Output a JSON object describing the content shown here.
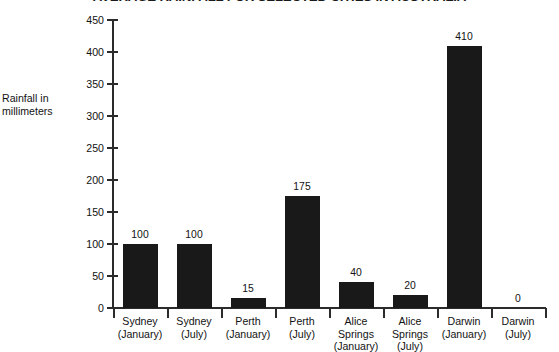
{
  "chart_data": {
    "type": "bar",
    "title": "AVERAGE RAINFALL FOR SELECTED CITIES IN AUSTRALIA",
    "xlabel": "",
    "ylabel": "Rainfall in millimeters",
    "ylabel_lines": [
      "Rainfall in",
      "millimeters"
    ],
    "ylim": [
      0,
      450
    ],
    "ytick_step": 50,
    "yticks": [
      0,
      50,
      100,
      150,
      200,
      250,
      300,
      350,
      400,
      450
    ],
    "ytick_labels": [
      "0",
      "50",
      "100",
      "150",
      "200",
      "250",
      "300",
      "350",
      "400",
      "450"
    ],
    "grid": false,
    "legend": false,
    "bar_color": "#191919",
    "axis_color": "#2b2b2b",
    "categories": [
      "Sydney (January)",
      "Sydney (July)",
      "Perth (January)",
      "Perth (July)",
      "Alice Springs (January)",
      "Alice Springs (July)",
      "Darwin (January)",
      "Darwin (July)"
    ],
    "category_lines": [
      [
        "Sydney",
        "(January)"
      ],
      [
        "Sydney",
        "(July)"
      ],
      [
        "Perth",
        "(January)"
      ],
      [
        "Perth",
        "(July)"
      ],
      [
        "Alice",
        "Springs",
        "(January)"
      ],
      [
        "Alice",
        "Springs",
        "(July)"
      ],
      [
        "Darwin",
        "(January)"
      ],
      [
        "Darwin",
        "(July)"
      ]
    ],
    "values": [
      100,
      100,
      15,
      175,
      40,
      20,
      410,
      0
    ],
    "value_labels": [
      "100",
      "100",
      "15",
      "175",
      "40",
      "20",
      "410",
      "0"
    ]
  }
}
